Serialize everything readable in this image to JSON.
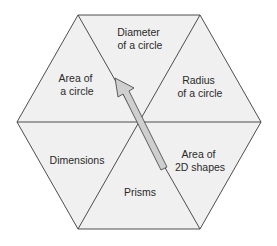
{
  "diagram": {
    "type": "hexagon-segments",
    "colors": {
      "fill": "#f0f0f0",
      "stroke": "#3a3a3a",
      "arrow_fill": "#cfcfcf",
      "text": "#2a2a2a"
    },
    "segments": [
      {
        "id": "top",
        "lines": [
          "Diameter",
          "of a circle"
        ]
      },
      {
        "id": "upper-right",
        "lines": [
          "Radius",
          "of a circle"
        ]
      },
      {
        "id": "lower-right",
        "lines": [
          "Area of",
          "2D shapes"
        ]
      },
      {
        "id": "bottom",
        "lines": [
          "Prisms"
        ]
      },
      {
        "id": "lower-left",
        "lines": [
          "Dimensions"
        ]
      },
      {
        "id": "upper-left",
        "lines": [
          "Area of",
          "a circle"
        ]
      }
    ],
    "arrow": {
      "from": "lower-right",
      "to": "upper-left"
    }
  }
}
